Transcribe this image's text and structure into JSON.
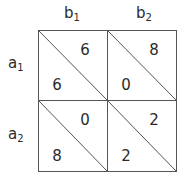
{
  "columns": [
    {
      "base": "b",
      "sub": "1"
    },
    {
      "base": "b",
      "sub": "2"
    }
  ],
  "rows": [
    {
      "base": "a",
      "sub": "1"
    },
    {
      "base": "a",
      "sub": "2"
    }
  ],
  "cells": [
    [
      {
        "upper": "6",
        "lower": "6"
      },
      {
        "upper": "8",
        "lower": "0"
      }
    ],
    [
      {
        "upper": "0",
        "lower": "8"
      },
      {
        "upper": "2",
        "lower": "2"
      }
    ]
  ],
  "colors": {
    "line": "#555555",
    "text": "#2a2a2a"
  }
}
